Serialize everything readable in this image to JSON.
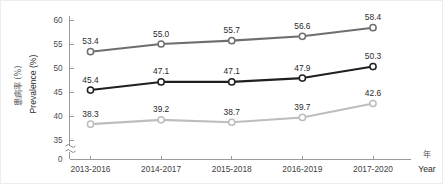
{
  "chart_data": {
    "type": "line",
    "title": "",
    "subtitle": "",
    "xlabel": "Year",
    "xlabel_cjk": "年",
    "ylabel": "Prevalence (%)",
    "ylabel_cjk": "患病率 (%)",
    "categories": [
      "2013-2016",
      "2014-2017",
      "2015-2018",
      "2016-2019",
      "2017-2020"
    ],
    "ylim": [
      35,
      60
    ],
    "yticks": [
      35,
      40,
      45,
      50,
      55,
      60
    ],
    "ytick_labels": [
      "35",
      "40",
      "45",
      "50",
      "55",
      "60"
    ],
    "axis_break": true,
    "axis_break_label": "0",
    "grid": false,
    "legend": "none",
    "series": [
      {
        "name": "series-top",
        "color": "#6e6e6e",
        "values": [
          53.4,
          55.0,
          55.7,
          56.6,
          58.4
        ],
        "labels": [
          "53.4",
          "55.0",
          "55.7",
          "56.6",
          "58.4"
        ]
      },
      {
        "name": "series-middle",
        "color": "#1f1f1f",
        "values": [
          45.4,
          47.1,
          47.1,
          47.9,
          50.3
        ],
        "labels": [
          "45.4",
          "47.1",
          "47.1",
          "47.9",
          "50.3"
        ]
      },
      {
        "name": "series-bottom",
        "color": "#bdbdbd",
        "values": [
          38.3,
          39.2,
          38.7,
          39.7,
          42.6
        ],
        "labels": [
          "38.3",
          "39.2",
          "38.7",
          "39.7",
          "42.6"
        ]
      }
    ]
  },
  "colors": {
    "background": "#ffffff",
    "frame": "#ededed",
    "axis": "#9a9a9a",
    "text": "#2b2b2b",
    "series_top": "#6e6e6e",
    "series_middle": "#1f1f1f",
    "series_bottom": "#bdbdbd"
  }
}
